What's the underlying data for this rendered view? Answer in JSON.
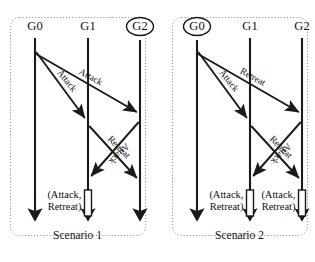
{
  "figure": {
    "type": "sequence-diagram-pair",
    "background": "#ffffff",
    "line_color": "#1a1a1a",
    "panel_border_color": "#9a9a9a"
  },
  "panels": [
    {
      "id": "scenario-1",
      "caption": "Scenario 1",
      "lifelines": [
        {
          "id": "g0",
          "label": "G0",
          "circled": false,
          "x": 25
        },
        {
          "id": "g1",
          "label": "G1",
          "circled": false,
          "x": 78
        },
        {
          "id": "g2",
          "label": "G2",
          "circled": true,
          "x": 130
        }
      ],
      "messages": [
        {
          "from": "g0",
          "to": "g1",
          "label": "Attack",
          "y_start": 52,
          "y_end": 118
        },
        {
          "from": "g0",
          "to": "g2",
          "label": "Attack",
          "y_start": 54,
          "y_end": 112
        },
        {
          "from": "g2",
          "to": "g1",
          "label": "Attack",
          "y_start": 122,
          "y_end": 176
        },
        {
          "from": "g1",
          "to": "g2",
          "label": "Retreat",
          "y_start": 126,
          "y_end": 178
        }
      ],
      "decisions": [
        {
          "lifeline": "g1",
          "label": "(Attack, Retreat)",
          "label_lines": [
            "(Attack,",
            "Retreat)"
          ],
          "side": "left"
        }
      ]
    },
    {
      "id": "scenario-2",
      "caption": "Scenario 2",
      "lifelines": [
        {
          "id": "g0",
          "label": "G0",
          "circled": true,
          "x": 25
        },
        {
          "id": "g1",
          "label": "G1",
          "circled": false,
          "x": 78
        },
        {
          "id": "g2",
          "label": "G2",
          "circled": false,
          "x": 130
        }
      ],
      "messages": [
        {
          "from": "g0",
          "to": "g1",
          "label": "Attack",
          "y_start": 52,
          "y_end": 118
        },
        {
          "from": "g0",
          "to": "g2",
          "label": "Retreat",
          "y_start": 54,
          "y_end": 112
        },
        {
          "from": "g2",
          "to": "g1",
          "label": "Attack",
          "y_start": 122,
          "y_end": 176
        },
        {
          "from": "g1",
          "to": "g2",
          "label": "Retreat",
          "y_start": 126,
          "y_end": 178
        }
      ],
      "decisions": [
        {
          "lifeline": "g1",
          "label": "(Attack, Retreat)",
          "label_lines": [
            "(Attack,",
            "Retreat)"
          ],
          "side": "left"
        },
        {
          "lifeline": "g2",
          "label": "(Attack, Retreat)",
          "label_lines": [
            "(Attack,",
            "Retreat)"
          ],
          "side": "left"
        }
      ]
    }
  ]
}
